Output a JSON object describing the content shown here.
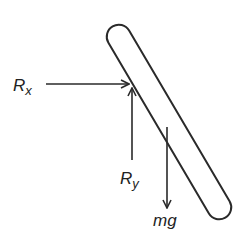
{
  "diagram": {
    "colors": {
      "stroke": "#2a2a2a",
      "background": "#ffffff"
    },
    "rod": {
      "shape": "capsule",
      "description": "slanted rod"
    },
    "forces": [
      {
        "id": "rx",
        "label": "R",
        "subscript": "x",
        "direction": "right"
      },
      {
        "id": "ry",
        "label": "R",
        "subscript": "y",
        "direction": "up"
      },
      {
        "id": "mg",
        "label": "mg",
        "subscript": "",
        "direction": "down"
      }
    ]
  }
}
